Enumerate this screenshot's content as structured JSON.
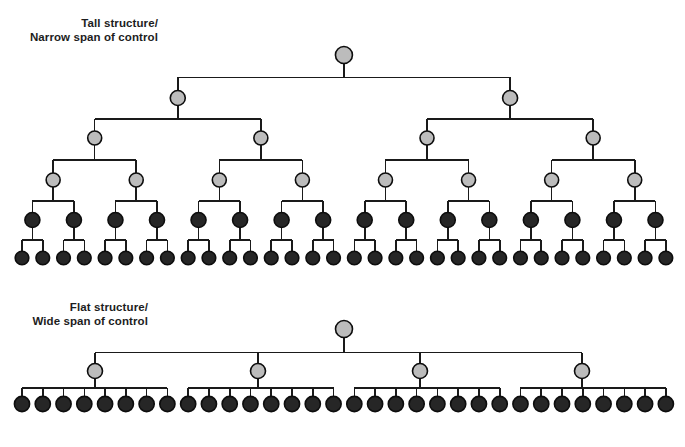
{
  "figure": {
    "width": 685,
    "height": 447,
    "background": "#ffffff"
  },
  "style": {
    "line_color": "#1a1a1a",
    "line_width": 1.6,
    "node_stroke": "#0d0d0d",
    "node_stroke_width": 1.6,
    "manager_fill": "#bcbcbc",
    "worker_fill": "#262626"
  },
  "captions": {
    "tall": {
      "line1": "Tall structure/",
      "line2": "Narrow span of control",
      "text": "Tall structure/\nNarrow span of control"
    },
    "flat": {
      "line1": "Flat structure/",
      "line2": "Wide span of control",
      "text": "Flat structure/\nWide span of control"
    }
  },
  "chart_data": {
    "type": "diagram",
    "diagram_kind": "organizational-hierarchy-tree",
    "charts": [
      {
        "id": "tall-structure",
        "label": "Tall structure/\nNarrow span of control",
        "span_of_control": 2,
        "levels": 6,
        "total_nodes": 63,
        "nodes_per_level": [
          1,
          2,
          4,
          8,
          16,
          32
        ],
        "level_y": [
          55,
          98,
          138,
          180,
          220,
          258
        ],
        "node_radius_by_level": [
          8.5,
          7.5,
          7.0,
          7.0,
          7.5,
          6.8
        ],
        "node_fill_by_level": [
          "#bcbcbc",
          "#bcbcbc",
          "#bcbcbc",
          "#bcbcbc",
          "#262626",
          "#262626"
        ],
        "leaf_x_start": 22,
        "leaf_x_end": 666,
        "leaf_spacing": 20.77
      },
      {
        "id": "flat-structure",
        "label": "Flat structure/\nWide span of control",
        "span_of_control": 8,
        "levels": 3,
        "total_nodes": 37,
        "nodes_per_level": [
          1,
          4,
          32
        ],
        "level_y": [
          329,
          371,
          404
        ],
        "node_radius_by_level": [
          8.5,
          7.5,
          7.6
        ],
        "node_fill_by_level": [
          "#bcbcbc",
          "#bcbcbc",
          "#262626"
        ],
        "manager_x": [
          95,
          258,
          420,
          582
        ],
        "leaf_x_start": 22,
        "leaf_x_end": 666,
        "leaf_spacing": 20.77,
        "root_x": 344
      }
    ]
  }
}
